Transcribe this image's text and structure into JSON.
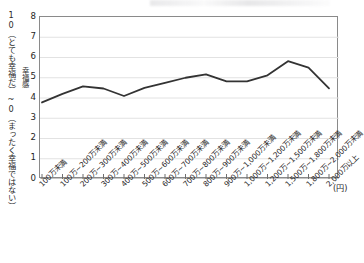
{
  "chart_data": {
    "type": "line",
    "title": "",
    "subtitle": "",
    "xlabel": "(円)",
    "ylabel": "幸福感",
    "ylabel_outer": "10（とても幸福だ）~0（まったく幸福ではない）",
    "ylim": [
      0,
      8
    ],
    "yticks": [
      0,
      1,
      2,
      3,
      4,
      5,
      6,
      7,
      8
    ],
    "grid": "horizontal",
    "legend": "none",
    "line_color": "#333333",
    "categories": [
      "100万未満",
      "100万~200万未満",
      "200万~300万未満",
      "300万~400万未満",
      "400万~500万未満",
      "500万~600万未満",
      "600万~700万未満",
      "700万~800万未満",
      "800万~900万未満",
      "900万~1,000万未満",
      "1,000万~1,200万未満",
      "1,200万~1,500万未満",
      "1,500万~1,800万未満",
      "1,800万~2,000万未満",
      "2,000万以上"
    ],
    "series": [
      {
        "name": "幸福感",
        "values": [
          3.78,
          4.2,
          4.57,
          4.47,
          4.1,
          4.5,
          4.75,
          5.0,
          5.17,
          4.82,
          4.82,
          5.12,
          5.82,
          5.5,
          4.48
        ]
      }
    ]
  }
}
